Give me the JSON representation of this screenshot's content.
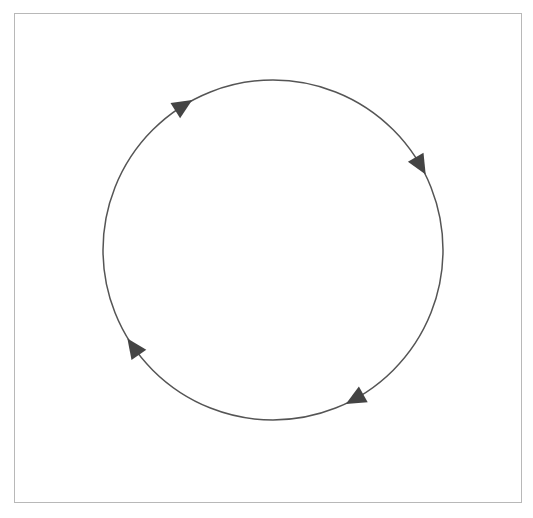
{
  "diagram": {
    "type": "cycle",
    "frame": {
      "x": 14,
      "y": 13,
      "width": 508,
      "height": 490,
      "stroke": "#b8b8b8"
    },
    "circle": {
      "cx": 273,
      "cy": 250,
      "r": 170,
      "stroke": "#555555",
      "stroke_width": 1.5
    },
    "direction": "clockwise",
    "arrowheads": [
      {
        "name": "arrow-top-left",
        "angle_deg": 238,
        "color": "#444444"
      },
      {
        "name": "arrow-right",
        "angle_deg": 330,
        "color": "#444444"
      },
      {
        "name": "arrow-bottom-right",
        "angle_deg": 61,
        "color": "#444444"
      },
      {
        "name": "arrow-left",
        "angle_deg": 145,
        "color": "#444444"
      }
    ],
    "labels": []
  }
}
